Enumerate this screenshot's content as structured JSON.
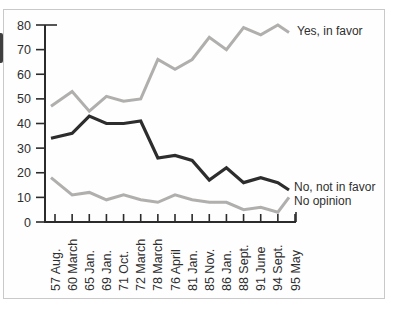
{
  "chart_data": {
    "type": "line",
    "categories": [
      "57 Aug.",
      "60 March",
      "65 Jan.",
      "69 Jan.",
      "71 Oct.",
      "72 March",
      "78 March",
      "76 April",
      "81 Jan.",
      "85 Nov.",
      "86 Jan.",
      "88 Sept.",
      "91 June",
      "94 Sept.",
      "95 May"
    ],
    "series": [
      {
        "name": "Yes, in favor",
        "color": "#b0afad",
        "width": 3,
        "values": [
          47,
          53,
          45,
          51,
          49,
          50,
          66,
          62,
          66,
          75,
          70,
          79,
          76,
          80,
          77
        ]
      },
      {
        "name": "No, not in favor",
        "color": "#2d2d2d",
        "width": 3.2,
        "values": [
          34,
          36,
          43,
          40,
          40,
          41,
          26,
          27,
          25,
          17,
          22,
          16,
          18,
          16,
          13
        ]
      },
      {
        "name": "No opinion",
        "color": "#b0afad",
        "width": 3,
        "values": [
          18,
          11,
          12,
          9,
          11,
          9,
          8,
          11,
          9,
          8,
          8,
          5,
          6,
          4,
          10
        ]
      }
    ],
    "ylim": [
      0,
      80
    ],
    "y_ticks": [
      0,
      10,
      20,
      30,
      40,
      50,
      60,
      70,
      80
    ],
    "grid": false,
    "legend_position": "end-of-line-labels-right",
    "axis_color": "#2b2b2b",
    "text_color": "#2e2e2e",
    "frame_color": "#c9c9c9"
  }
}
